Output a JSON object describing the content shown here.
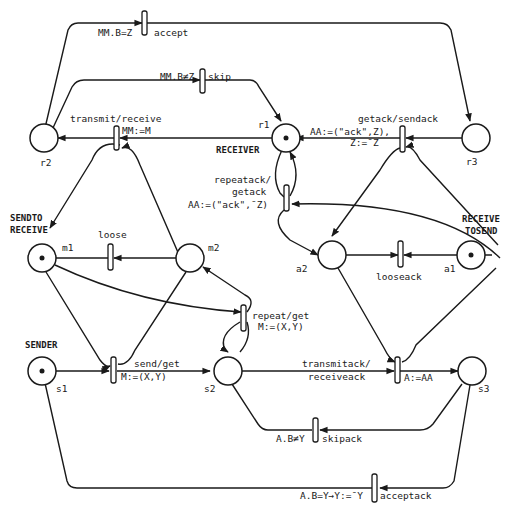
{
  "diagram": {
    "type": "petri-net",
    "places": [
      {
        "id": "r1",
        "label": "r1",
        "caption": "RECEIVER",
        "token": true
      },
      {
        "id": "r2",
        "label": "r2",
        "caption": "",
        "token": false
      },
      {
        "id": "r3",
        "label": "r3",
        "caption": "",
        "token": false
      },
      {
        "id": "m1",
        "label": "m1",
        "caption_line1": "SENDTO",
        "caption_line2": "RECEIVE",
        "token": true
      },
      {
        "id": "m2",
        "label": "m2",
        "caption": "",
        "token": false
      },
      {
        "id": "a1",
        "label": "a1",
        "caption_line1": "RECEIVE",
        "caption_line2": "TOSEND",
        "token": true
      },
      {
        "id": "a2",
        "label": "a2",
        "caption": "",
        "token": false
      },
      {
        "id": "s1",
        "label": "s1",
        "caption": "SENDER",
        "token": true
      },
      {
        "id": "s2",
        "label": "s2",
        "caption": "",
        "token": false
      },
      {
        "id": "s3",
        "label": "s3",
        "caption": "",
        "token": false
      }
    ],
    "transitions": {
      "accept": {
        "name": "accept",
        "guard": "MM.B=Z"
      },
      "skip": {
        "name": "skip",
        "guard": "MM.B≠Z"
      },
      "transmit": {
        "name": "transmit/receive",
        "action": "MM:=M"
      },
      "getack": {
        "name": "getack/sendack",
        "action1": "AA:=(\"ack\",Z),",
        "action2": "Z:=¯Z"
      },
      "repeatack": {
        "line1": "repeatack/",
        "line2": "getack",
        "action": "AA:=(\"ack\",¯Z)"
      },
      "loose": {
        "name": "loose"
      },
      "looseack": {
        "name": "looseack"
      },
      "repeat": {
        "name": "repeat/get",
        "action": "M:=(X,Y)"
      },
      "send": {
        "name": "send/get",
        "action": "M:=(X,Y)"
      },
      "transmitack": {
        "line1": "transmitack/",
        "line2": "receiveack",
        "action": "A:=AA"
      },
      "skipack": {
        "name": "skipack",
        "guard": "A.B≠Y"
      },
      "acceptack": {
        "name": "acceptack",
        "guard": "A.B=Y→Y:=¯Y"
      }
    }
  }
}
